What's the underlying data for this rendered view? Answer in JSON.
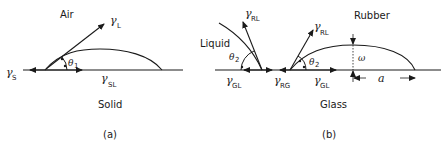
{
  "panel_a": {
    "caption": "(a)",
    "upper_medium": "Air",
    "lower_medium": "Solid",
    "angle_label": "θ",
    "angle_sub": "1",
    "gamma_l": {
      "sym": "γ",
      "sub": "L"
    },
    "gamma_s": {
      "sym": "γ",
      "sub": "S"
    },
    "gamma_sl": {
      "sym": "γ",
      "sub": "SL"
    }
  },
  "panel_b": {
    "caption": "(b)",
    "left_medium": "Liquid",
    "upper_medium": "Rubber",
    "lower_medium": "Glass",
    "angle_left": {
      "sym": "θ",
      "sub": "2"
    },
    "angle_right": {
      "sym": "θ",
      "sub": "2"
    },
    "gamma_rl_left": {
      "sym": "γ",
      "sub": "RL"
    },
    "gamma_rl_right": {
      "sym": "γ",
      "sub": "RL"
    },
    "gamma_gl_left": {
      "sym": "γ",
      "sub": "GL"
    },
    "gamma_rg": {
      "sym": "γ",
      "sub": "RG"
    },
    "gamma_gl_right": {
      "sym": "γ",
      "sub": "GL"
    },
    "height_label": "ω",
    "radius_label": "a"
  },
  "colors": {
    "ink": "#1a1a1a",
    "background": "#ffffff"
  }
}
